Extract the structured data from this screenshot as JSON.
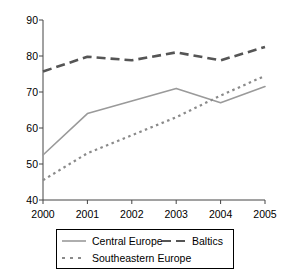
{
  "chart_data": {
    "type": "line",
    "title": "",
    "subtitle": "",
    "xlabel": "",
    "ylabel": "",
    "categories": [
      "2000",
      "2001",
      "2002",
      "2003",
      "2004",
      "2005"
    ],
    "x": [
      2000,
      2001,
      2002,
      2003,
      2004,
      2005
    ],
    "xlim": [
      2000,
      2005
    ],
    "ylim": [
      40,
      90
    ],
    "yticks": [
      "40",
      "50",
      "60",
      "70",
      "80",
      "90"
    ],
    "ytick_values": [
      40,
      50,
      60,
      70,
      80,
      90
    ],
    "xticks": [
      "2000",
      "2001",
      "2002",
      "2003",
      "2004",
      "2005"
    ],
    "grid": false,
    "legend_position": "below",
    "series": [
      {
        "name": "Central Europe",
        "style": "solid",
        "color": "#9a9a9a",
        "values": [
          52.5,
          64.0,
          67.5,
          71.0,
          67.0,
          71.5
        ]
      },
      {
        "name": "Baltics",
        "style": "dashed",
        "color": "#555555",
        "values": [
          75.7,
          79.8,
          78.8,
          81.0,
          78.8,
          82.5
        ]
      },
      {
        "name": "Southeastern Europe",
        "style": "dotted",
        "color": "#8a8a8a",
        "values": [
          45.5,
          53.0,
          58.0,
          63.0,
          69.0,
          74.5
        ]
      }
    ]
  },
  "axis": {
    "color": "#444444"
  },
  "legend": {
    "entries": [
      {
        "label": "Central Europe"
      },
      {
        "label": "Southeastern Europe"
      },
      {
        "label": "Baltics"
      }
    ]
  }
}
